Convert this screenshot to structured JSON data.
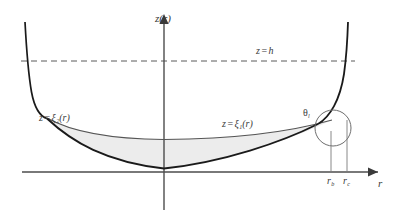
{
  "figure": {
    "kind": "wetting-meniscus-schematic",
    "background_color": "#ffffff",
    "axes": {
      "vertical_axis_label": "z(r)",
      "horizontal_axis_label": "r",
      "axis_color": "#4d4d4d",
      "origin_label": ""
    },
    "labels": {
      "height_line": {
        "lhs": "z",
        "eq": "=",
        "rhs": "h"
      },
      "outer_profile": {
        "lhs": "z",
        "eq": "=",
        "symbol": "ξ",
        "sub": "2",
        "arg": "(r)"
      },
      "inner_profile": {
        "lhs": "z",
        "eq": "=",
        "symbol": "ξ",
        "sub": "1",
        "arg": "(r)"
      },
      "contact_angle": {
        "symbol": "θ",
        "sub": "l"
      },
      "tick_rb": {
        "symbol": "r",
        "sub": "b"
      },
      "tick_rc": {
        "symbol": "r",
        "sub": "c"
      }
    },
    "annotations": {
      "dashed_line_style": "dashed",
      "dashed_line_color": "#5a5a5a",
      "shaded_region_color": "#ececec",
      "outer_curve_color": "#1a1a1a",
      "inner_curve_color": "#555555",
      "highlight_circle_color": "#6e6e6e",
      "tick_line_color": "#7a7a7a"
    },
    "geometry": {
      "z_axis_x": 164,
      "r_axis_y": 172,
      "dashed_z_h_y": 61,
      "r_b_x": 331,
      "r_c_x": 347,
      "circle_center_x": 333,
      "circle_center_y": 128,
      "circle_radius": 18
    }
  }
}
